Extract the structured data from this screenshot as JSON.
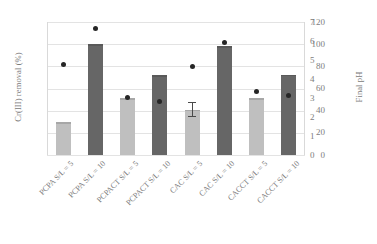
{
  "chart_data": {
    "type": "bar",
    "title": "",
    "xlabel": "",
    "ylabel": "Cr(III) removal (%)",
    "y2label": "Final pH",
    "ylim": [
      0,
      120
    ],
    "y2lim": [
      0,
      7
    ],
    "grid": true,
    "legend": "none",
    "categories": [
      "PCPA S/L = 5",
      "PCPA S/L = 10",
      "PCPACT S/L = 5",
      "PCPACT S/L = 10",
      "CAC S/L = 5",
      "CAC S/L = 10",
      "CACCT S/L = 5",
      "CACCT S/L = 10"
    ],
    "y_ticks": [
      "0",
      "20",
      "40",
      "60",
      "80",
      "100",
      "120"
    ],
    "y2_ticks": [
      "0",
      "1",
      "2",
      "3",
      "4",
      "5",
      "6",
      "7"
    ],
    "series": [
      {
        "name": "Cr(III) removal (%)",
        "axis": "left",
        "type": "bar",
        "values": [
          29.5,
          100.0,
          51.0,
          72.0,
          41.0,
          98.0,
          51.0,
          72.5
        ],
        "colors": [
          "#bfbfbf",
          "#666666",
          "#bfbfbf",
          "#666666",
          "#bfbfbf",
          "#666666",
          "#bfbfbf",
          "#666666"
        ],
        "errors": [
          null,
          null,
          null,
          null,
          {
            "plus": 7.0,
            "minus": 7.0
          },
          null,
          null,
          null
        ]
      },
      {
        "name": "Final pH",
        "axis": "right",
        "type": "scatter",
        "marker": "circle",
        "color": "#262626",
        "values": [
          4.75,
          6.68,
          3.05,
          2.8,
          4.68,
          5.9,
          3.35,
          3.15
        ]
      }
    ]
  }
}
